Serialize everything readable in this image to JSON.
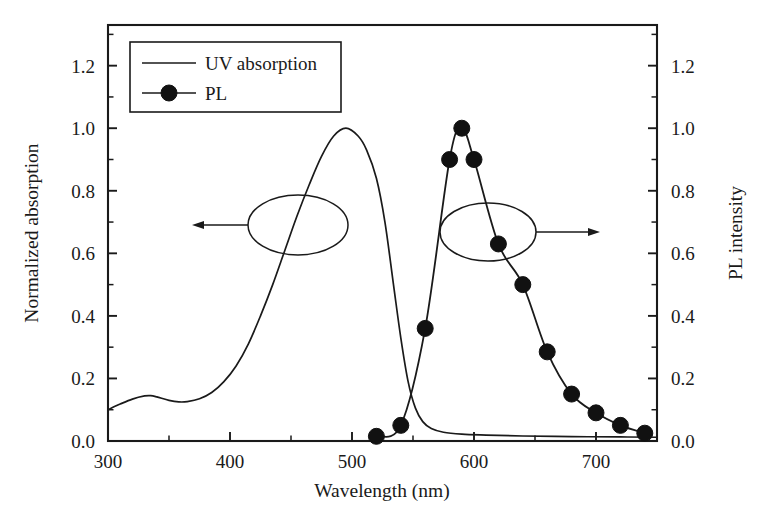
{
  "chart_data": {
    "type": "line",
    "title": "",
    "subtitle": "",
    "xlabel": "Wavelength (nm)",
    "ylabel": "Normalized absorption",
    "y2label": "PL intensity",
    "xlim": [
      300,
      750
    ],
    "ylim": [
      0.0,
      1.33
    ],
    "y2lim": [
      0.0,
      1.33
    ],
    "xticks": [
      300,
      400,
      500,
      600,
      700
    ],
    "xticklabels": [
      "300",
      "400",
      "500",
      "600",
      "700"
    ],
    "xminorticks": [
      350,
      450,
      550,
      650,
      750
    ],
    "yticks": [
      0.0,
      0.2,
      0.4,
      0.6,
      0.8,
      1.0,
      1.2
    ],
    "yticklabels": [
      "0.0",
      "0.2",
      "0.4",
      "0.6",
      "0.8",
      "1.0",
      "1.2"
    ],
    "yminorticks": [
      0.1,
      0.3,
      0.5,
      0.7,
      0.9,
      1.1,
      1.3
    ],
    "y2ticks": [
      0.0,
      0.2,
      0.4,
      0.6,
      0.8,
      1.0,
      1.2
    ],
    "y2ticklabels": [
      "0.0",
      "0.2",
      "0.4",
      "0.6",
      "0.8",
      "1.0",
      "1.2"
    ],
    "grid": false,
    "legend_position": "top-left",
    "series": [
      {
        "name": "UV absorption",
        "axis": "left",
        "marker": "none",
        "color": "#1a1a1a",
        "x": [
          300,
          310,
          320,
          330,
          335,
          340,
          350,
          358,
          365,
          375,
          385,
          395,
          405,
          415,
          425,
          435,
          445,
          455,
          465,
          475,
          485,
          495,
          505,
          512,
          520,
          527,
          534,
          540,
          546,
          552,
          558,
          565,
          575,
          590,
          610,
          640,
          680,
          720,
          750
        ],
        "y": [
          0.1,
          0.118,
          0.134,
          0.144,
          0.145,
          0.141,
          0.13,
          0.125,
          0.126,
          0.135,
          0.155,
          0.19,
          0.24,
          0.31,
          0.4,
          0.5,
          0.61,
          0.72,
          0.82,
          0.91,
          0.975,
          1.0,
          0.975,
          0.93,
          0.84,
          0.7,
          0.5,
          0.33,
          0.19,
          0.105,
          0.062,
          0.04,
          0.028,
          0.022,
          0.019,
          0.016,
          0.014,
          0.013,
          0.012
        ]
      },
      {
        "name": "PL",
        "axis": "right",
        "marker": "filled-circle",
        "color": "#111111",
        "x": [
          520,
          540,
          560,
          580,
          590,
          600,
          620,
          640,
          660,
          680,
          700,
          720,
          740
        ],
        "y": [
          0.015,
          0.05,
          0.36,
          0.9,
          1.0,
          0.9,
          0.63,
          0.5,
          0.285,
          0.15,
          0.09,
          0.05,
          0.025
        ]
      }
    ],
    "annotations": [
      {
        "name": "left-axis-pointer",
        "type": "ellipse-with-arrow",
        "direction": "left",
        "ellipse_center_x": 490,
        "ellipse_center_y": 0.655,
        "target_axis": "Normalized absorption"
      },
      {
        "name": "right-axis-pointer",
        "type": "ellipse-with-arrow",
        "direction": "right",
        "ellipse_center_x": 620,
        "ellipse_center_y": 0.655,
        "target_axis": "PL intensity"
      }
    ]
  },
  "legend": {
    "entries": [
      {
        "label": "UV absorption",
        "marker": "none"
      },
      {
        "label": "PL",
        "marker": "filled-circle"
      }
    ]
  }
}
